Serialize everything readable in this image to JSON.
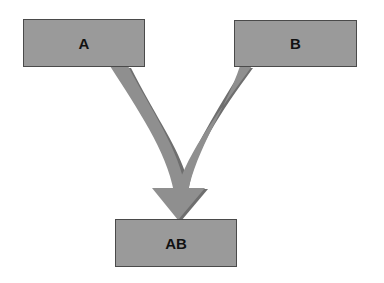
{
  "diagram": {
    "type": "merge-flow",
    "nodes": [
      {
        "id": "A",
        "label": "A"
      },
      {
        "id": "B",
        "label": "B"
      },
      {
        "id": "AB",
        "label": "AB"
      }
    ],
    "edges": [
      {
        "from": "A",
        "to": "AB"
      },
      {
        "from": "B",
        "to": "AB"
      }
    ],
    "colors": {
      "box_fill": "#9a9a9a",
      "box_border": "#4a4a4a",
      "arrow_fill": "#8f8f8f",
      "arrow_shadow": "#6e6e6e"
    }
  }
}
